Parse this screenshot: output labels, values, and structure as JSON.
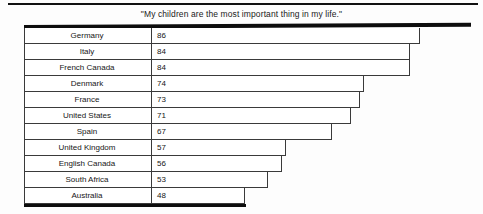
{
  "chart_data": {
    "type": "bar",
    "title": "\"My children are the most important thing in my life.\"",
    "xlabel": "",
    "ylabel": "",
    "orientation": "horizontal",
    "grid": false,
    "legend": null,
    "xlim": [
      0,
      100
    ],
    "categories": [
      "Germany",
      "Italy",
      "French Canada",
      "Denmark",
      "France",
      "United States",
      "Spain",
      "United Kingdom",
      "English Canada",
      "South Africa",
      "Australia"
    ],
    "values": [
      86,
      84,
      84,
      74,
      73,
      71,
      67,
      57,
      56,
      53,
      48
    ],
    "rows": [
      {
        "label": "Germany",
        "value": "86",
        "pct": 86
      },
      {
        "label": "Italy",
        "value": "84",
        "pct": 84
      },
      {
        "label": "French Canada",
        "value": "84",
        "pct": 84
      },
      {
        "label": "Denmark",
        "value": "74",
        "pct": 74
      },
      {
        "label": "France",
        "value": "73",
        "pct": 73
      },
      {
        "label": "United States",
        "value": "71",
        "pct": 71
      },
      {
        "label": "Spain",
        "value": "67",
        "pct": 67
      },
      {
        "label": "United Kingdom",
        "value": "57",
        "pct": 57
      },
      {
        "label": "English Canada",
        "value": "56",
        "pct": 56
      },
      {
        "label": "South Africa",
        "value": "53",
        "pct": 53
      },
      {
        "label": "Australia",
        "value": "48",
        "pct": 48
      }
    ]
  },
  "style": {
    "border_color": "#3a3a3a",
    "heavy_border_color": "#0d0d0d",
    "background": "#fdfdfd",
    "text_color": "#161616"
  }
}
